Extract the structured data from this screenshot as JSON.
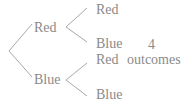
{
  "diagram": {
    "type": "tree",
    "colors": {
      "line": "#a8a8a8",
      "text": "#8a8a8a"
    },
    "level1": [
      {
        "label": "Red",
        "children": [
          {
            "label": "Red"
          },
          {
            "label": "Blue"
          }
        ]
      },
      {
        "label": "Blue",
        "children": [
          {
            "label": "Red"
          },
          {
            "label": "Blue"
          }
        ]
      }
    ],
    "annotation": {
      "count": "4",
      "text": "outcomes"
    }
  }
}
